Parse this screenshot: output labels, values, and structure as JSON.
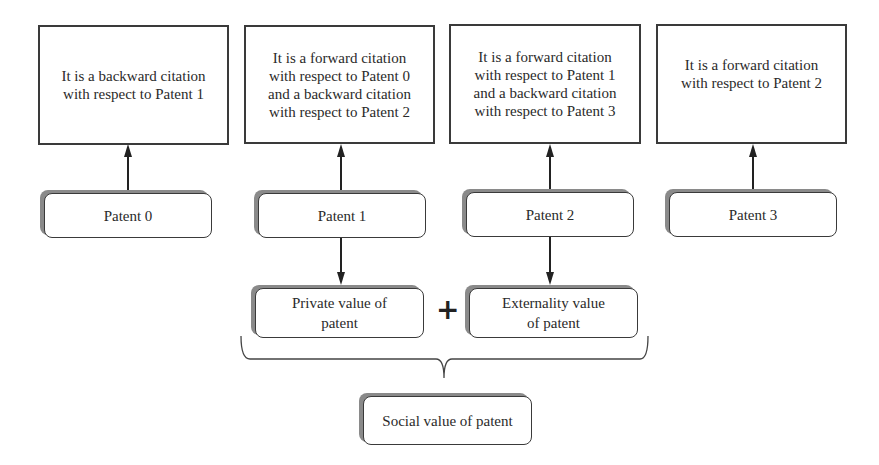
{
  "citation_boxes": [
    {
      "text": "It is a backward citation with respect to Patent 1",
      "lines": [
        "It is a backward citation",
        "with respect to Patent 1"
      ]
    },
    {
      "text": "It is a forward citation with respect to Patent 0 and a backward citation with respect to Patent 2",
      "lines": [
        "It is a forward citation",
        "with respect to Patent 0",
        "and a backward citation",
        "with respect to Patent 2"
      ]
    },
    {
      "text": "It is a forward citation with respect to Patent 1 and a backward citation with respect to Patent 3",
      "lines": [
        "It is a forward citation",
        "with respect to Patent 1",
        "and a backward citation",
        "with respect to Patent 3"
      ]
    },
    {
      "text": "It is a forward citation with respect to Patent 2",
      "lines": [
        "It is a forward citation",
        "with respect to Patent 2"
      ]
    }
  ],
  "patents": [
    {
      "label": "Patent 0"
    },
    {
      "label": "Patent 1"
    },
    {
      "label": "Patent 2"
    },
    {
      "label": "Patent 3"
    }
  ],
  "values": {
    "private": {
      "lines": [
        "Private value of",
        "patent"
      ]
    },
    "operator": "+",
    "externality": {
      "lines": [
        "Externality value",
        "of patent"
      ]
    },
    "social": {
      "label": "Social value of patent"
    }
  },
  "colors": {
    "stroke": "#3a3a3a",
    "shadow": "#8a8a8a",
    "background": "#ffffff"
  }
}
